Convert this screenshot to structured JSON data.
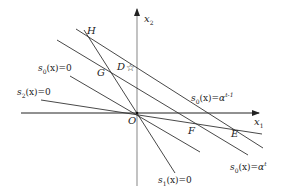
{
  "diagram": {
    "type": "geometric decision-boundary diagram",
    "axes": {
      "x1_label": "x",
      "x1_sub": "1",
      "x2_label": "x",
      "x2_sub": "2",
      "origin_label": "O"
    },
    "points": {
      "H": "H",
      "G": "G",
      "D": "D",
      "F": "F",
      "E": "E",
      "O": "O",
      "star": "☆"
    },
    "line_labels": {
      "s0_zero": {
        "fn": "s",
        "sub": "0",
        "arg": "(x)",
        "rhs": "=0"
      },
      "s2_zero": {
        "fn": "s",
        "sub": "2",
        "arg": "(x)",
        "rhs": "=0"
      },
      "s1_zero": {
        "fn": "s",
        "sub": "1",
        "arg": "(x)",
        "rhs": "=0"
      },
      "s0_alpha_t_minus_1": {
        "fn": "s",
        "sub": "0",
        "arg": "(x)",
        "rhs": "=α",
        "sup": "t-1"
      },
      "s0_alpha_t": {
        "fn": "s",
        "sub": "0",
        "arg": "(x)",
        "rhs": "=α",
        "sup": "t"
      }
    },
    "colors": {
      "line": "#333333",
      "axis": "#222222",
      "axis_y": "#999999"
    }
  }
}
